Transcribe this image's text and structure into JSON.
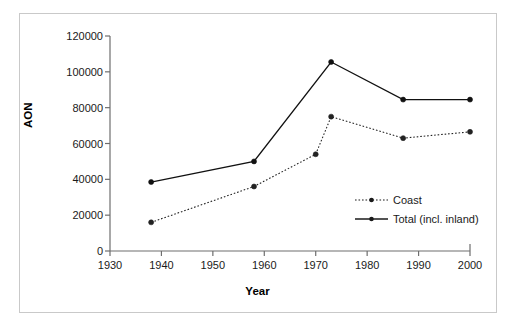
{
  "chart_data": {
    "type": "line",
    "title": "",
    "xlabel": "Year",
    "ylabel": "AON",
    "xlim": [
      1930,
      2000
    ],
    "ylim": [
      0,
      120000
    ],
    "xticks": [
      1930,
      1940,
      1950,
      1960,
      1970,
      1980,
      1990,
      2000
    ],
    "xtick_labels": [
      "1930",
      "1940",
      "1950",
      "1960",
      "1970",
      "1980",
      "1990",
      "2000"
    ],
    "yticks": [
      0,
      20000,
      40000,
      60000,
      80000,
      100000,
      120000
    ],
    "ytick_labels": [
      "0",
      "20000",
      "40000",
      "60000",
      "80000",
      "100000",
      "120000"
    ],
    "grid": false,
    "legend_position": "inside-right",
    "series": [
      {
        "name": "Coast",
        "style": "dotted",
        "marker": "circle",
        "color": "#222222",
        "x": [
          1938,
          1958,
          1970,
          1973,
          1987,
          2000
        ],
        "values": [
          16000,
          36000,
          54000,
          75000,
          63000,
          66500
        ]
      },
      {
        "name": "Total (incl. inland)",
        "style": "solid",
        "marker": "circle",
        "color": "#111111",
        "x": [
          1938,
          1958,
          1973,
          1987,
          2000
        ],
        "values": [
          38500,
          50000,
          105500,
          84500,
          84500
        ]
      }
    ]
  },
  "legend": {
    "items": [
      {
        "label": "Coast",
        "style": "dotted"
      },
      {
        "label": "Total (incl. inland)",
        "style": "solid"
      }
    ]
  },
  "axes": {
    "ylabel": "AON",
    "xlabel": "Year"
  }
}
